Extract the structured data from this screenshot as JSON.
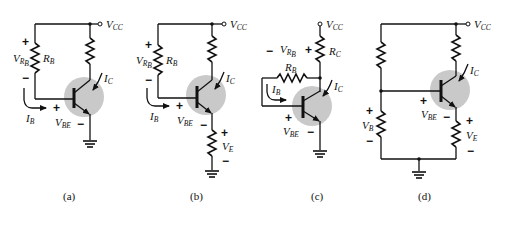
{
  "figure": {
    "panels": [
      {
        "caption": "(a)",
        "supply": {
          "main": "V",
          "sub": "CC"
        },
        "base_resistor": {
          "main": "R",
          "sub": "B"
        },
        "base_resistor_voltage": {
          "main": "V",
          "sub": "R",
          "subsub": "B"
        },
        "base_current": {
          "main": "I",
          "sub": "B"
        },
        "collector_current": {
          "main": "I",
          "sub": "C"
        },
        "vbe": {
          "main": "V",
          "sub": "BE"
        },
        "plus": "+",
        "minus": "−"
      },
      {
        "caption": "(b)",
        "supply": {
          "main": "V",
          "sub": "CC"
        },
        "base_resistor": {
          "main": "R",
          "sub": "B"
        },
        "base_resistor_voltage": {
          "main": "V",
          "sub": "R",
          "subsub": "B"
        },
        "base_current": {
          "main": "I",
          "sub": "B"
        },
        "collector_current": {
          "main": "I",
          "sub": "C"
        },
        "vbe": {
          "main": "V",
          "sub": "BE"
        },
        "emitter_voltage": {
          "main": "V",
          "sub": "E"
        },
        "plus": "+",
        "minus": "−"
      },
      {
        "caption": "(c)",
        "supply": {
          "main": "V",
          "sub": "CC"
        },
        "collector_resistor": {
          "main": "R",
          "sub": "C"
        },
        "base_resistor": {
          "main": "R",
          "sub": "B"
        },
        "base_resistor_voltage": {
          "main": "V",
          "sub": "R",
          "subsub": "B"
        },
        "base_current": {
          "main": "I",
          "sub": "B"
        },
        "collector_current": {
          "main": "I",
          "sub": "C"
        },
        "vbe": {
          "main": "V",
          "sub": "BE"
        },
        "plus": "+",
        "minus": "−"
      },
      {
        "caption": "(d)",
        "supply": {
          "main": "V",
          "sub": "CC"
        },
        "collector_current": {
          "main": "I",
          "sub": "C"
        },
        "vbe": {
          "main": "V",
          "sub": "BE"
        },
        "base_voltage": {
          "main": "V",
          "sub": "B"
        },
        "emitter_voltage": {
          "main": "V",
          "sub": "E"
        },
        "plus": "+",
        "minus": "−"
      }
    ]
  }
}
